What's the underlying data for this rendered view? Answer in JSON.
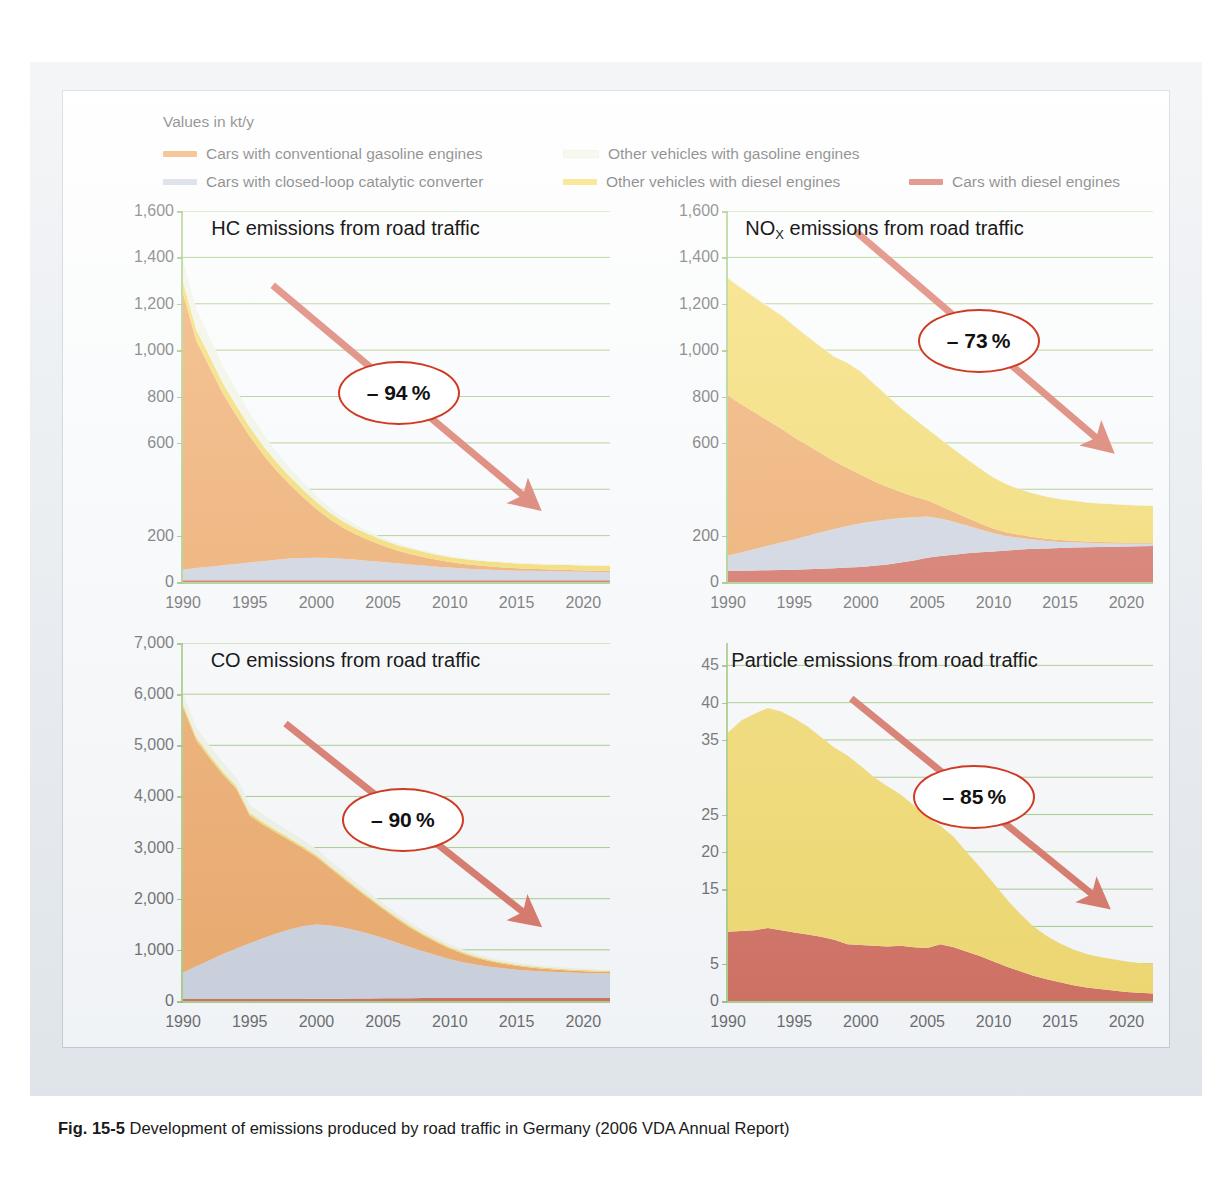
{
  "legend": {
    "units": "Values in kt/y",
    "items": [
      {
        "label": "Cars with conventional gasoline engines",
        "color": "#f08a2a"
      },
      {
        "label": "Other vehicles with gasoline engines",
        "color": "#f2f5e0"
      },
      {
        "label": "Cars with closed-loop catalytic converter",
        "color": "#bfc6d6"
      },
      {
        "label": "Other vehicles with diesel engines",
        "color": "#f7d12f"
      },
      {
        "label": "Cars with diesel engines",
        "color": "#c8311a"
      }
    ]
  },
  "caption": {
    "figure": "Fig. 15-5",
    "text": "Development of emissions produced by road traffic in Germany (2006 VDA Annual Report)"
  },
  "colors": {
    "gasoline_cars": "#f08a2a",
    "gasoline_other": "#f2f5e0",
    "catalytic_cars": "#bfc6d6",
    "diesel_other": "#f7d12f",
    "diesel_cars": "#c8311a",
    "gridline": "#86b84f",
    "axis": "#8fbf5a",
    "arrow": "#cf3a22",
    "frame": "#e6eaee"
  },
  "chart_data": [
    {
      "id": "hc",
      "type": "area",
      "title": "HC emissions from road traffic",
      "annotation": "– 94 %",
      "xlabel": "",
      "ylabel": "",
      "unit": "kt/y",
      "xlim": [
        1990,
        2022
      ],
      "ylim": [
        0,
        1600
      ],
      "yticks": [
        0,
        200,
        600,
        800,
        1000,
        1200,
        1400,
        1600
      ],
      "ygrid": [
        0,
        200,
        400,
        600,
        800,
        1000,
        1200,
        1400,
        1600
      ],
      "xticks": [
        1990,
        1995,
        2000,
        2005,
        2010,
        2015,
        2020
      ],
      "grid": true,
      "stack_order": [
        "Cars with diesel engines",
        "Cars with closed-loop catalytic converter",
        "Cars with conventional gasoline engines",
        "Other vehicles with diesel engines",
        "Other vehicles with gasoline engines"
      ],
      "x": [
        1990,
        1991,
        1992,
        1993,
        1994,
        1995,
        1996,
        1997,
        1998,
        1999,
        2000,
        2001,
        2002,
        2003,
        2004,
        2005,
        2006,
        2007,
        2008,
        2009,
        2010,
        2011,
        2012,
        2013,
        2014,
        2015,
        2016,
        2017,
        2018,
        2019,
        2020,
        2021,
        2022
      ],
      "series": [
        {
          "name": "Cars with diesel engines",
          "color": "#c8311a",
          "values": [
            8,
            8,
            8,
            8,
            8,
            8,
            8,
            8,
            8,
            8,
            8,
            8,
            8,
            8,
            8,
            8,
            8,
            8,
            8,
            8,
            8,
            8,
            8,
            8,
            8,
            8,
            8,
            8,
            8,
            8,
            8,
            8,
            8
          ]
        },
        {
          "name": "Cars with closed-loop catalytic converter",
          "color": "#bfc6d6",
          "values": [
            45,
            52,
            58,
            64,
            70,
            76,
            82,
            88,
            93,
            96,
            97,
            95,
            92,
            88,
            83,
            78,
            73,
            68,
            63,
            58,
            54,
            50,
            47,
            45,
            43,
            41,
            40,
            39,
            38,
            37,
            36,
            35,
            34
          ]
        },
        {
          "name": "Cars with conventional gasoline engines",
          "color": "#f08a2a",
          "values": [
            1190,
            980,
            860,
            740,
            640,
            545,
            460,
            385,
            320,
            262,
            210,
            168,
            134,
            108,
            88,
            70,
            56,
            45,
            37,
            30,
            24,
            20,
            17,
            14,
            12,
            10,
            9,
            8,
            7,
            7,
            6,
            6,
            6
          ]
        },
        {
          "name": "Other vehicles with diesel engines",
          "color": "#f7d12f",
          "values": [
            50,
            48,
            46,
            44,
            42,
            40,
            38,
            36,
            34,
            32,
            30,
            28,
            27,
            26,
            25,
            24,
            23,
            23,
            22,
            22,
            21,
            21,
            21,
            21,
            21,
            21,
            21,
            21,
            21,
            21,
            21,
            21,
            21
          ]
        },
        {
          "name": "Other vehicles with gasoline engines",
          "color": "#f2f5e0",
          "values": [
            95,
            88,
            82,
            75,
            68,
            60,
            52,
            45,
            38,
            32,
            26,
            22,
            18,
            15,
            12,
            10,
            8,
            7,
            6,
            5,
            4,
            4,
            3,
            3,
            3,
            3,
            3,
            3,
            3,
            3,
            3,
            3,
            3
          ]
        }
      ],
      "totals": [
        1388,
        1176,
        1054,
        931,
        828,
        729,
        640,
        562,
        493,
        430,
        371,
        321,
        279,
        245,
        216,
        190,
        168,
        151,
        136,
        123,
        111,
        103,
        96,
        91,
        87,
        83,
        81,
        79,
        77,
        76,
        74,
        73,
        72
      ]
    },
    {
      "id": "nox",
      "type": "area",
      "title_prefix": "NO",
      "title_sub": "X",
      "title_suffix": " emissions from road traffic",
      "title": "NOX emissions from road traffic",
      "annotation": "– 73 %",
      "xlabel": "",
      "ylabel": "",
      "unit": "kt/y",
      "xlim": [
        1990,
        2022
      ],
      "ylim": [
        0,
        1600
      ],
      "yticks": [
        0,
        200,
        600,
        800,
        1000,
        1200,
        1400,
        1600
      ],
      "ygrid": [
        0,
        200,
        400,
        600,
        800,
        1000,
        1200,
        1400,
        1600
      ],
      "xticks": [
        1990,
        1995,
        2000,
        2005,
        2010,
        2015,
        2020
      ],
      "grid": true,
      "x": [
        1990,
        1991,
        1992,
        1993,
        1994,
        1995,
        1996,
        1997,
        1998,
        1999,
        2000,
        2001,
        2002,
        2003,
        2004,
        2005,
        2006,
        2007,
        2008,
        2009,
        2010,
        2011,
        2012,
        2013,
        2014,
        2015,
        2016,
        2017,
        2018,
        2019,
        2020,
        2021,
        2022
      ],
      "series": [
        {
          "name": "Cars with diesel engines",
          "color": "#c8311a",
          "values": [
            48,
            49,
            50,
            51,
            52,
            53,
            55,
            57,
            59,
            62,
            65,
            70,
            76,
            84,
            93,
            105,
            112,
            118,
            124,
            128,
            132,
            136,
            140,
            143,
            145,
            147,
            149,
            150,
            151,
            152,
            153,
            154,
            155
          ]
        },
        {
          "name": "Cars with closed-loop catalytic converter",
          "color": "#bfc6d6",
          "values": [
            66,
            78,
            92,
            105,
            118,
            130,
            145,
            158,
            170,
            180,
            188,
            192,
            194,
            192,
            186,
            178,
            162,
            142,
            120,
            98,
            78,
            62,
            50,
            40,
            32,
            26,
            22,
            19,
            16,
            14,
            12,
            11,
            10
          ]
        },
        {
          "name": "Cars with conventional gasoline engines",
          "color": "#f08a2a",
          "values": [
            690,
            640,
            590,
            540,
            492,
            440,
            390,
            340,
            292,
            250,
            210,
            172,
            140,
            112,
            90,
            70,
            54,
            42,
            33,
            26,
            20,
            16,
            13,
            11,
            9,
            8,
            7,
            6,
            6,
            5,
            5,
            5,
            5
          ]
        },
        {
          "name": "Other vehicles with diesel engines",
          "color": "#f7d12f",
          "values": [
            505,
            500,
            495,
            492,
            488,
            480,
            468,
            458,
            450,
            452,
            444,
            420,
            392,
            364,
            336,
            308,
            288,
            270,
            252,
            236,
            220,
            206,
            196,
            188,
            182,
            176,
            172,
            168,
            166,
            164,
            162,
            160,
            158
          ]
        },
        {
          "name": "Other vehicles with gasoline engines",
          "color": "#f2f5e0",
          "values": [
            6,
            6,
            5,
            5,
            5,
            4,
            4,
            4,
            3,
            3,
            3,
            3,
            2,
            2,
            2,
            2,
            2,
            2,
            2,
            2,
            1,
            1,
            1,
            1,
            1,
            1,
            1,
            1,
            1,
            1,
            1,
            1,
            1
          ]
        }
      ],
      "totals": [
        1315,
        1273,
        1232,
        1193,
        1155,
        1107,
        1062,
        1017,
        974,
        947,
        910,
        857,
        804,
        754,
        707,
        663,
        618,
        574,
        531,
        490,
        451,
        421,
        400,
        383,
        369,
        358,
        351,
        344,
        340,
        336,
        333,
        331,
        329
      ]
    },
    {
      "id": "co",
      "type": "area",
      "title": "CO emissions from road traffic",
      "annotation": "– 90 %",
      "xlabel": "",
      "ylabel": "",
      "unit": "kt/y",
      "xlim": [
        1990,
        2022
      ],
      "ylim": [
        0,
        7000
      ],
      "yticks": [
        0,
        1000,
        2000,
        3000,
        4000,
        5000,
        6000,
        7000
      ],
      "ygrid": [
        0,
        1000,
        2000,
        3000,
        4000,
        5000,
        6000,
        7000
      ],
      "xticks": [
        1990,
        1995,
        2000,
        2005,
        2010,
        2015,
        2020
      ],
      "grid": true,
      "x": [
        1990,
        1991,
        1992,
        1993,
        1994,
        1995,
        1996,
        1997,
        1998,
        1999,
        2000,
        2001,
        2002,
        2003,
        2004,
        2005,
        2006,
        2007,
        2008,
        2009,
        2010,
        2011,
        2012,
        2013,
        2014,
        2015,
        2016,
        2017,
        2018,
        2019,
        2020,
        2021,
        2022
      ],
      "series": [
        {
          "name": "Cars with diesel engines",
          "color": "#c8311a",
          "values": [
            38,
            38,
            38,
            38,
            38,
            38,
            38,
            38,
            38,
            40,
            42,
            44,
            46,
            48,
            50,
            52,
            54,
            56,
            58,
            58,
            58,
            58,
            58,
            58,
            58,
            58,
            58,
            58,
            58,
            58,
            58,
            58,
            58
          ]
        },
        {
          "name": "Cars with closed-loop catalytic converter",
          "color": "#bfc6d6",
          "values": [
            520,
            640,
            760,
            880,
            990,
            1090,
            1190,
            1280,
            1360,
            1420,
            1455,
            1430,
            1390,
            1330,
            1260,
            1180,
            1090,
            1000,
            915,
            835,
            760,
            700,
            650,
            610,
            580,
            555,
            535,
            520,
            508,
            498,
            490,
            484,
            478
          ]
        },
        {
          "name": "Cars with conventional gasoline engines",
          "color": "#f08a2a",
          "values": [
            5190,
            4420,
            3950,
            3510,
            3120,
            2500,
            2220,
            1970,
            1740,
            1520,
            1320,
            1130,
            960,
            810,
            680,
            565,
            465,
            382,
            312,
            254,
            205,
            166,
            134,
            110,
            90,
            74,
            62,
            53,
            46,
            40,
            36,
            32,
            30
          ]
        },
        {
          "name": "Other vehicles with diesel engines",
          "color": "#f7d12f",
          "values": [
            60,
            58,
            56,
            54,
            52,
            50,
            48,
            46,
            44,
            42,
            40,
            38,
            36,
            35,
            34,
            33,
            32,
            31,
            30,
            29,
            28,
            27,
            26,
            25,
            24,
            24,
            23,
            23,
            22,
            22,
            22,
            21,
            21
          ]
        },
        {
          "name": "Other vehicles with gasoline engines",
          "color": "#f2f5e0",
          "values": [
            200,
            195,
            188,
            180,
            172,
            162,
            152,
            143,
            134,
            126,
            118,
            110,
            102,
            95,
            88,
            82,
            76,
            70,
            65,
            60,
            55,
            50,
            46,
            42,
            39,
            36,
            34,
            32,
            30,
            29,
            28,
            27,
            26
          ]
        }
      ],
      "totals": [
        6008,
        5351,
        4992,
        4662,
        4372,
        3840,
        3648,
        3477,
        3316,
        3148,
        2975,
        2752,
        2534,
        2318,
        2112,
        1912,
        1717,
        1539,
        1380,
        1236,
        1106,
        1001,
        914,
        845,
        791,
        747,
        712,
        686,
        664,
        647,
        634,
        622,
        613
      ]
    },
    {
      "id": "particles",
      "type": "area",
      "title": "Particle emissions from road traffic",
      "annotation": "– 85 %",
      "xlabel": "",
      "ylabel": "",
      "unit": "kt/y",
      "xlim": [
        1990,
        2022
      ],
      "ylim": [
        0,
        48
      ],
      "yticks": [
        0,
        5,
        15,
        20,
        25,
        35,
        40,
        45
      ],
      "ygrid": [
        0,
        5,
        10,
        15,
        20,
        25,
        30,
        35,
        40,
        45
      ],
      "xticks": [
        1990,
        1995,
        2000,
        2005,
        2010,
        2015,
        2020
      ],
      "grid": true,
      "x": [
        1990,
        1991,
        1992,
        1993,
        1994,
        1995,
        1996,
        1997,
        1998,
        1999,
        2000,
        2001,
        2002,
        2003,
        2004,
        2005,
        2006,
        2007,
        2008,
        2009,
        2010,
        2011,
        2012,
        2013,
        2014,
        2015,
        2016,
        2017,
        2018,
        2019,
        2020,
        2021,
        2022
      ],
      "series": [
        {
          "name": "Cars with diesel engines",
          "color": "#c8311a",
          "values": [
            9.3,
            9.4,
            9.5,
            9.8,
            9.5,
            9.2,
            8.9,
            8.6,
            8.2,
            7.6,
            7.5,
            7.4,
            7.3,
            7.4,
            7.2,
            7.1,
            7.6,
            7.2,
            6.6,
            6.0,
            5.3,
            4.6,
            4.0,
            3.4,
            2.9,
            2.5,
            2.1,
            1.8,
            1.6,
            1.4,
            1.2,
            1.1,
            1.0
          ]
        },
        {
          "name": "Other vehicles with diesel engines",
          "color": "#f7d12f",
          "values": [
            26.7,
            28.2,
            29.0,
            29.5,
            29.3,
            28.7,
            27.9,
            26.8,
            25.8,
            25.3,
            24.0,
            22.6,
            21.5,
            20.3,
            19.0,
            17.5,
            15.9,
            14.8,
            13.3,
            11.9,
            10.5,
            9.0,
            7.7,
            6.6,
            5.8,
            5.2,
            4.8,
            4.5,
            4.3,
            4.2,
            4.1,
            4.0,
            4.0
          ]
        }
      ],
      "totals": [
        36.0,
        37.6,
        38.5,
        39.3,
        38.8,
        37.9,
        36.8,
        35.4,
        34.0,
        32.9,
        31.5,
        30.0,
        28.8,
        27.7,
        26.2,
        24.6,
        23.5,
        22.0,
        19.9,
        17.9,
        15.8,
        13.6,
        11.7,
        10.0,
        8.7,
        7.7,
        6.9,
        6.3,
        5.9,
        5.6,
        5.3,
        5.1,
        5.0
      ]
    }
  ]
}
